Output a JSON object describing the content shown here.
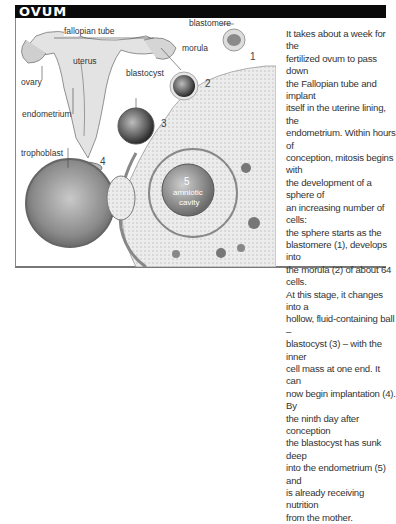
{
  "header": {
    "title": "OVUM"
  },
  "diagram": {
    "labels": {
      "fallopian_tube": "fallopian tube",
      "uterus": "uterus",
      "ovary": "ovary",
      "endometrium": "endometrium",
      "trophoblast": "trophoblast",
      "blastomere": "blastomere",
      "morula": "morula",
      "blastocyst": "blastocyst",
      "amniotic_cavity_line1": "amniotic",
      "amniotic_cavity_line2": "cavity"
    },
    "stage_numbers": [
      "1",
      "2",
      "3",
      "4",
      "5"
    ]
  },
  "body": {
    "text_lines": [
      "It takes about a week for the",
      "fertilized ovum to pass down",
      "the Fallopian tube and implant",
      "itself in the uterine lining, the",
      "endometrium. Within hours of",
      "conception, mitosis begins with",
      "the development of a sphere of",
      "an increasing number of cells:",
      "the sphere starts as the",
      "blastomere (1), develops into",
      "the morula (2) of about 64 cells.",
      "At this stage, it changes into a",
      "hollow, fluid-containing ball –",
      "blastocyst (3) – with the inner",
      "cell mass at one end. It can",
      "now begin implantation (4). By",
      "the ninth day after conception",
      "the blastocyst has sunk deep",
      "into the endometrium (5) and",
      "is already receiving nutrition",
      "from the mother."
    ]
  }
}
